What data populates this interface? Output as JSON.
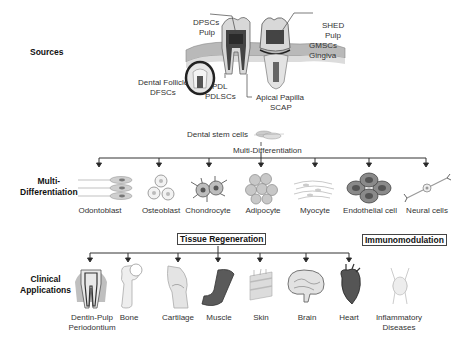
{
  "sections": {
    "sources": "Sources",
    "multi_differentiation_line1": "Multi-",
    "multi_differentiation_line2": "Differentiation",
    "clinical_line1": "Clinical",
    "clinical_line2": "Applications"
  },
  "sources": {
    "dpsc": {
      "line1": "DPSCs",
      "line2": "Pulp"
    },
    "shed": {
      "line1": "SHED",
      "line2": "Pulp"
    },
    "gmsc": {
      "line1": "GMSCs",
      "line2": "Gingiva"
    },
    "dfsc": {
      "line1": "Dental Follicle",
      "line2": "DFSCs"
    },
    "pdl": {
      "line1": "PDL",
      "line2": "PDLSCs"
    },
    "scap": {
      "line1": "Apical Papilla",
      "line2": "SCAP"
    }
  },
  "differentiation": {
    "stem_cells_label": "Dental stem cells",
    "process_label": "Multi-Differentiation",
    "cells": [
      {
        "label": "Odontoblast"
      },
      {
        "label": "Osteoblast"
      },
      {
        "label": "Chondrocyte"
      },
      {
        "label": "Adipocyte"
      },
      {
        "label": "Myocyte"
      },
      {
        "label": "Endothelial cell"
      },
      {
        "label": "Neural cells"
      }
    ]
  },
  "clinical": {
    "tissue_regeneration": "Tissue Regeneration",
    "immunomodulation": "Immunomodulation",
    "tissues": [
      {
        "line1": "Dentin-Pulp",
        "line2": "Periodontium"
      },
      {
        "line1": "Bone"
      },
      {
        "line1": "Cartilage"
      },
      {
        "line1": "Muscle"
      },
      {
        "line1": "Skin"
      },
      {
        "line1": "Brain"
      },
      {
        "line1": "Heart"
      }
    ],
    "diseases": {
      "line1": "Inflammatory",
      "line2": "Diseases"
    }
  }
}
